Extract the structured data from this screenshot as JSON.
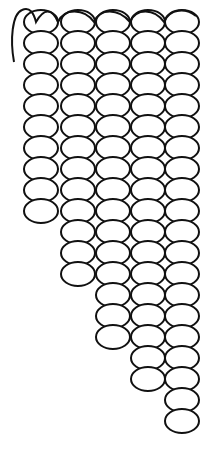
{
  "illustration": {
    "subject": "beadwork-stitch-diagram",
    "stroke_color": "#111111",
    "fill_color": "#ffffff",
    "background": "#ffffff",
    "columns": [
      {
        "index": 1,
        "cx": 41,
        "top_y": 22,
        "bead_count": 10
      },
      {
        "index": 2,
        "cx": 78,
        "top_y": 22,
        "bead_count": 13
      },
      {
        "index": 3,
        "cx": 113,
        "top_y": 22,
        "bead_count": 16
      },
      {
        "index": 4,
        "cx": 148,
        "top_y": 22,
        "bead_count": 18
      },
      {
        "index": 5,
        "cx": 182,
        "top_y": 22,
        "bead_count": 20
      }
    ],
    "bead": {
      "rx": 17,
      "ry": 12,
      "row_pitch": 21
    }
  }
}
